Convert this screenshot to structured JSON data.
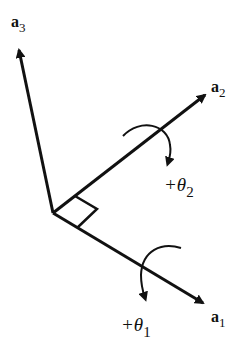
{
  "diagram": {
    "type": "coordinate-axes",
    "stroke_color": "#111111",
    "background": "#ffffff",
    "axes": [
      {
        "id": "a1",
        "label": "a",
        "subscript": "1"
      },
      {
        "id": "a2",
        "label": "a",
        "subscript": "2"
      },
      {
        "id": "a3",
        "label": "a",
        "subscript": "3"
      }
    ],
    "rotations": [
      {
        "id": "theta1",
        "label": "+θ",
        "subscript": "1",
        "axis": "a1"
      },
      {
        "id": "theta2",
        "label": "+θ",
        "subscript": "2",
        "axis": "a2"
      }
    ],
    "right_angle_marker": true
  }
}
